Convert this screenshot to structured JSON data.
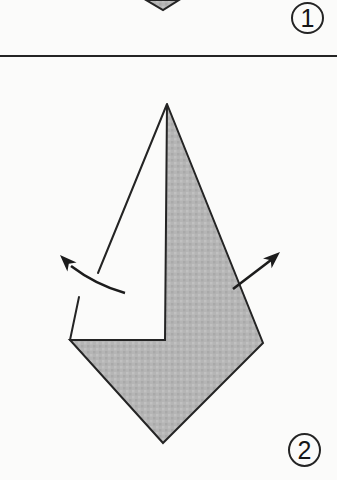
{
  "diagram": {
    "type": "origami-step-diagram",
    "panels": [
      {
        "step_label": "1"
      },
      {
        "step_label": "2"
      }
    ],
    "icons": {
      "left_arrow": "unfold-arrow-left",
      "right_arrow": "unfold-arrow-right"
    },
    "colors": {
      "outline": "#242424",
      "arrow": "#1c1c1c",
      "shaded_fill": "#b5b5b5",
      "shaded_fill_light": "#c1c1c1",
      "shaded_fill_dark": "#a9a9a9",
      "background": "#fbfbfa"
    }
  }
}
